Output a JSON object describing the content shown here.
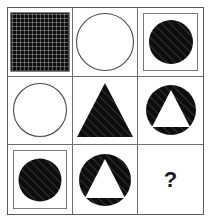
{
  "puzzle": {
    "kind": "matrix-reasoning-3x3",
    "rows": 3,
    "columns": 3,
    "colors": {
      "outer_border": "#5a5a5a",
      "grid_line": "#6e6e6e",
      "inner_frame": "#7a7a7a",
      "fill_dark": "#0d0d0d",
      "hatch_line": "#3a3a3a",
      "outline": "#4a4a4a",
      "background": "#ffffff",
      "question_mark": "#1a1a1a"
    },
    "cells": [
      {
        "position": "row1-col1",
        "name": "cell-hatched-square",
        "shape": "square",
        "fill": "grid-texture",
        "framed": false,
        "cutout": "none",
        "label": ""
      },
      {
        "position": "row1-col2",
        "name": "cell-outline-circle",
        "shape": "circle",
        "fill": "outline",
        "framed": false,
        "cutout": "none",
        "label": ""
      },
      {
        "position": "row1-col3",
        "name": "cell-framed-hatched-circle",
        "shape": "circle",
        "fill": "diagonal-hatch",
        "framed": true,
        "cutout": "none",
        "label": ""
      },
      {
        "position": "row2-col1",
        "name": "cell-outline-circle",
        "shape": "circle",
        "fill": "outline",
        "framed": false,
        "cutout": "none",
        "label": ""
      },
      {
        "position": "row2-col2",
        "name": "cell-hatched-triangle",
        "shape": "triangle",
        "fill": "diagonal-hatch",
        "framed": false,
        "cutout": "none",
        "label": ""
      },
      {
        "position": "row2-col3",
        "name": "cell-hatched-circle-triangle-cutout",
        "shape": "circle",
        "fill": "diagonal-hatch",
        "framed": false,
        "cutout": "triangle",
        "label": ""
      },
      {
        "position": "row3-col1",
        "name": "cell-framed-hatched-circle",
        "shape": "circle",
        "fill": "diagonal-hatch",
        "framed": true,
        "cutout": "none",
        "label": ""
      },
      {
        "position": "row3-col2",
        "name": "cell-hatched-circle-triangle-cutout",
        "shape": "circle",
        "fill": "diagonal-hatch",
        "framed": false,
        "cutout": "triangle",
        "label": ""
      },
      {
        "position": "row3-col3",
        "name": "cell-missing-answer",
        "shape": "none",
        "fill": "none",
        "framed": false,
        "cutout": "none",
        "label": "?"
      }
    ]
  }
}
